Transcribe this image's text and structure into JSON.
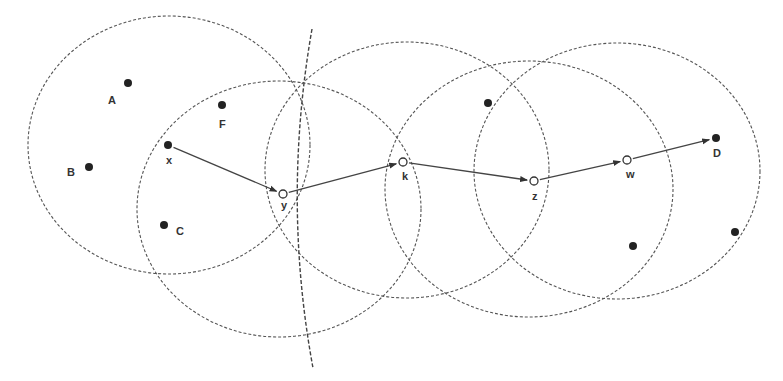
{
  "diagram": {
    "type": "routing-diagram",
    "colors": {
      "background": "#ffffff",
      "circle_stroke": "#555555",
      "arrow": "#444444",
      "node_fill": "#222222",
      "relay_fill": "#ffffff"
    },
    "circles": [
      {
        "id": "range-x",
        "cx": 169,
        "cy": 145,
        "rx": 141,
        "ry": 129
      },
      {
        "id": "range-y",
        "cx": 279,
        "cy": 209,
        "rx": 142,
        "ry": 128
      },
      {
        "id": "range-k",
        "cx": 407,
        "cy": 170,
        "rx": 142,
        "ry": 128
      },
      {
        "id": "range-z",
        "cx": 529,
        "cy": 189,
        "rx": 144,
        "ry": 128
      },
      {
        "id": "range-w",
        "cx": 617,
        "cy": 171,
        "rx": 143,
        "ry": 128
      }
    ],
    "boundary_curve": {
      "path": "M312,29 Q282,200 313,368"
    },
    "nodes": [
      {
        "id": "A",
        "label": "A",
        "x": 128,
        "y": 83,
        "kind": "solid",
        "lx": 108,
        "ly": 104
      },
      {
        "id": "B",
        "label": "B",
        "x": 89,
        "y": 167,
        "kind": "solid",
        "lx": 67,
        "ly": 176
      },
      {
        "id": "F",
        "label": "F",
        "x": 222,
        "y": 105,
        "kind": "solid",
        "lx": 219,
        "ly": 128
      },
      {
        "id": "x",
        "label": "x",
        "x": 168,
        "y": 145,
        "kind": "solid",
        "lx": 166,
        "ly": 164
      },
      {
        "id": "C",
        "label": "C",
        "x": 164,
        "y": 225,
        "kind": "solid",
        "lx": 176,
        "ly": 235
      },
      {
        "id": "y",
        "label": "y",
        "x": 283,
        "y": 194,
        "kind": "hollow",
        "lx": 281,
        "ly": 209
      },
      {
        "id": "k",
        "label": "k",
        "x": 403,
        "y": 162,
        "kind": "hollow",
        "lx": 402,
        "ly": 180
      },
      {
        "id": "z",
        "label": "z",
        "x": 534,
        "y": 181,
        "kind": "hollow",
        "lx": 532,
        "ly": 200
      },
      {
        "id": "w",
        "label": "w",
        "x": 627,
        "y": 160,
        "kind": "hollow",
        "lx": 626,
        "ly": 178
      },
      {
        "id": "D",
        "label": "D",
        "x": 716,
        "y": 138,
        "kind": "solid",
        "lx": 713,
        "ly": 157
      },
      {
        "id": "n1",
        "label": "",
        "x": 488,
        "y": 103,
        "kind": "solid"
      },
      {
        "id": "n2",
        "label": "",
        "x": 633,
        "y": 246,
        "kind": "solid"
      },
      {
        "id": "n3",
        "label": "",
        "x": 735,
        "y": 232,
        "kind": "solid"
      }
    ],
    "path": [
      "x",
      "y",
      "k",
      "z",
      "w",
      "D"
    ]
  }
}
